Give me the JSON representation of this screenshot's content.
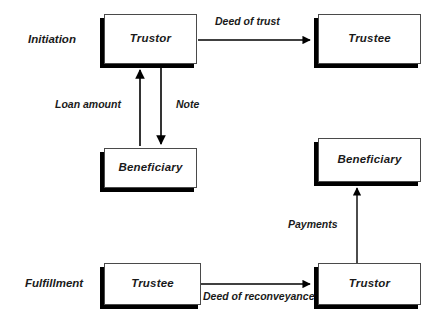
{
  "diagram": {
    "background": "#ffffff",
    "ink": "#000000",
    "box_fill": "#ffffff",
    "shadow_color": "#000000"
  },
  "stages": [
    {
      "id": "initiation",
      "label": "Initiation"
    },
    {
      "id": "fulfillment",
      "label": "Fulfillment"
    }
  ],
  "nodes": [
    {
      "id": "trustor-top",
      "label": "Trustor"
    },
    {
      "id": "trustee-top",
      "label": "Trustee"
    },
    {
      "id": "beneficiary-left",
      "label": "Beneficiary"
    },
    {
      "id": "beneficiary-right",
      "label": "Beneficiary"
    },
    {
      "id": "trustee-bottom",
      "label": "Trustee"
    },
    {
      "id": "trustor-bottom",
      "label": "Trustor"
    }
  ],
  "edges": [
    {
      "id": "deed-of-trust",
      "label": "Deed of trust",
      "from": "trustor-top",
      "to": "trustee-top",
      "direction": "right"
    },
    {
      "id": "loan-amount",
      "label": "Loan amount",
      "from": "beneficiary-left",
      "to": "trustor-top",
      "direction": "up"
    },
    {
      "id": "note",
      "label": "Note",
      "from": "trustor-top",
      "to": "beneficiary-left",
      "direction": "down"
    },
    {
      "id": "payments",
      "label": "Payments",
      "from": "trustor-bottom",
      "to": "beneficiary-right",
      "direction": "up"
    },
    {
      "id": "deed-of-reconveyance",
      "label": "Deed of reconveyance",
      "from": "trustee-bottom",
      "to": "trustor-bottom",
      "direction": "right"
    }
  ]
}
